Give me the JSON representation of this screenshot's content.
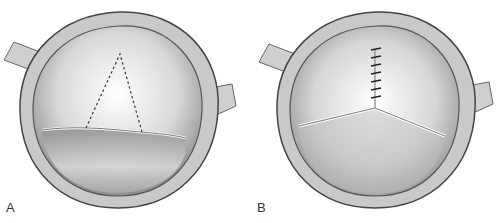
{
  "figure": {
    "panels": [
      {
        "id": "A",
        "label": "A",
        "description": "Valve viewed from above with dashed triangular incision outline"
      },
      {
        "id": "B",
        "label": "B",
        "description": "Valve viewed from above with sutured commissure and three leaflets"
      }
    ],
    "colors": {
      "ring": "#c8c8c8",
      "outline": "#444444",
      "leaflet_light": "#eeeeee",
      "leaflet_dark": "#9a9a9a"
    }
  }
}
